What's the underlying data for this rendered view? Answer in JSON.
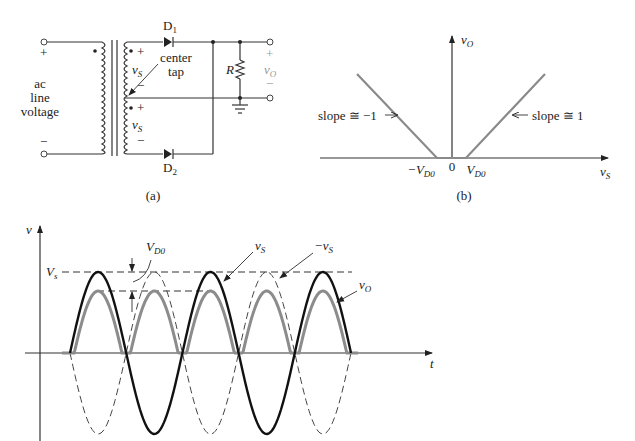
{
  "figure_a": {
    "caption": "(a)",
    "input_plus": "+",
    "input_minus": "−",
    "input_label_lines": [
      "ac",
      "line",
      "voltage"
    ],
    "d1_label": "D",
    "d1_sub": "1",
    "d2_label": "D",
    "d2_sub": "2",
    "center_tap_lines": [
      "center",
      "tap"
    ],
    "vs_top": "v",
    "vs_top_sub": "S",
    "vs_bottom": "v",
    "vs_bottom_sub": "S",
    "sec_top_plus": "+",
    "sec_top_minus": "−",
    "sec_bot_plus": "+",
    "sec_bot_minus": "−",
    "resistor_label": "R",
    "out_plus": "+",
    "out_minus": "−",
    "vo_label": "v",
    "vo_sub": "O"
  },
  "figure_b": {
    "caption": "(b)",
    "y_axis_label": "v",
    "y_axis_sub": "O",
    "x_axis_label": "v",
    "x_axis_sub": "S",
    "neg_vd0": "−V",
    "neg_vd0_sub": "D0",
    "zero": "0",
    "pos_vd0": "V",
    "pos_vd0_sub": "D0",
    "slope_left": "slope ≅ −1",
    "slope_right": "slope ≅ 1"
  },
  "figure_c": {
    "y_axis_label": "v",
    "x_axis_label": "t",
    "vs_peak_label": "V",
    "vs_peak_sub": "s",
    "vd0_label": "V",
    "vd0_sub": "D0",
    "vs_label": "v",
    "vs_sub": "S",
    "neg_vs_label": "−v",
    "neg_vs_sub": "S",
    "vo_label": "v",
    "vo_sub": "O"
  },
  "chart_data": [
    {
      "type": "line",
      "title": "(b) Transfer characteristic",
      "xlabel": "vS",
      "ylabel": "vO",
      "series": [
        {
          "name": "vO (vS < -VD0)",
          "x": [
            -6,
            -1
          ],
          "y": [
            5,
            0
          ],
          "slope": -1
        },
        {
          "name": "vO (|vS| <= VD0)",
          "x": [
            -1,
            1
          ],
          "y": [
            0,
            0
          ]
        },
        {
          "name": "vO (vS > VD0)",
          "x": [
            1,
            6
          ],
          "y": [
            0,
            5
          ],
          "slope": 1
        }
      ],
      "annotations": [
        "-VD0",
        "0",
        "VD0",
        "slope ≅ -1",
        "slope ≅ 1"
      ]
    },
    {
      "type": "line",
      "title": "(c) Waveforms",
      "xlabel": "t",
      "ylabel": "v",
      "series": [
        {
          "name": "vS",
          "style": "solid black",
          "shape": "sine",
          "amplitude": "Vs",
          "half_cycles": 5
        },
        {
          "name": "-vS",
          "style": "dashed",
          "shape": "inverted sine",
          "amplitude": "Vs",
          "half_cycles": 5
        },
        {
          "name": "vO",
          "style": "solid gray",
          "shape": "full-wave rectified",
          "peak": "Vs - VD0"
        }
      ],
      "annotations": [
        "Vs",
        "VD0",
        "vS",
        "-vS",
        "vO"
      ]
    }
  ]
}
